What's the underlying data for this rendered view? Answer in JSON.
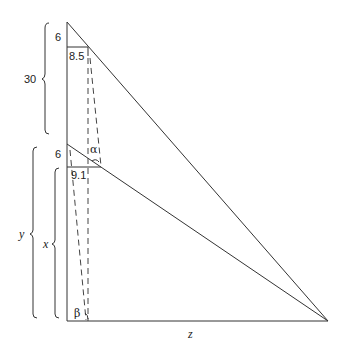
{
  "diagram": {
    "colors": {
      "line": "#333333",
      "background": "#ffffff"
    },
    "labels": {
      "top_segment": "6",
      "top_width": "8.5",
      "upper_bracket": "30",
      "mid_segment": "6",
      "mid_width": "9.1",
      "alpha": "α",
      "beta": "β",
      "y_bracket": "y",
      "x_bracket": "x",
      "z_base": "z"
    }
  }
}
